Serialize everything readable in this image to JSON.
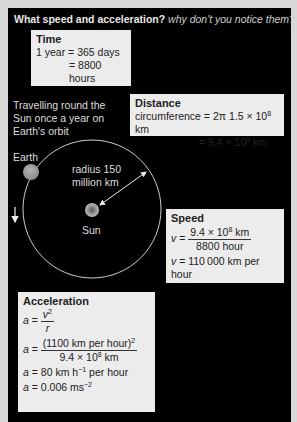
{
  "title": {
    "bold": "What speed and acceleration?",
    "italic": "why don't you notice them?"
  },
  "time_box": {
    "heading": "Time",
    "line1": "1 year = 365 days",
    "line2": "= 8800 hours"
  },
  "distance_box": {
    "heading": "Distance",
    "line1_pre": "circumference = 2π 1.5 × 10",
    "line1_exp": "8",
    "line1_unit": " km",
    "line2_pre": "= 9.4 × 10",
    "line2_exp": "8",
    "line2_unit": " km"
  },
  "speed_box": {
    "heading": "Speed",
    "var": "v",
    "eq": " = ",
    "num_pre": "9.4 × 10",
    "num_exp": "8",
    "num_unit": " km",
    "den": "8800 hour",
    "result_rest": " = 110 000 km per hour"
  },
  "acceleration_box": {
    "heading": "Acceleration",
    "var_a": "a",
    "eq": " = ",
    "f1_num": "v",
    "f1_num_exp": "2",
    "f1_den": "r",
    "f2_num": "(1100 km per hour)",
    "f2_num_exp": "2",
    "f2_den_pre": "9.4 × 10",
    "f2_den_exp": "8",
    "f2_den_unit": " km",
    "l3_pre": " = 80 km h",
    "l3_exp": "−1",
    "l3_post": " per hour",
    "l4_pre": " = 0.006 ms",
    "l4_exp": "−2"
  },
  "diagram": {
    "caption_lines": [
      "Travelling round the",
      "Sun once a year on",
      "Earth's orbit"
    ],
    "earth_label": "Earth",
    "sun_label": "Sun",
    "radius_lines": [
      "radius 150",
      "million km"
    ],
    "direction_icon": "down-arrow-icon"
  },
  "colors": {
    "panel": "#000000",
    "box": "#ececec",
    "background": "#d8d8d8"
  }
}
